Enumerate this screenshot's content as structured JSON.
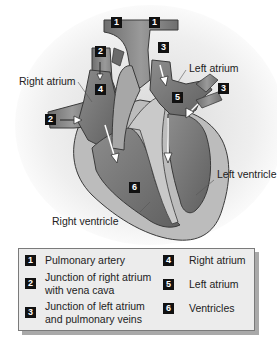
{
  "diagram": {
    "labels": {
      "right_atrium": "Right atrium",
      "left_atrium": "Left atrium",
      "left_ventricle": "Left ventricle",
      "right_ventricle": "Right ventricle"
    },
    "markers": [
      {
        "id": "1a",
        "number": "1"
      },
      {
        "id": "1b",
        "number": "1"
      },
      {
        "id": "2a",
        "number": "2"
      },
      {
        "id": "2b",
        "number": "2"
      },
      {
        "id": "3a",
        "number": "3"
      },
      {
        "id": "3b",
        "number": "3"
      },
      {
        "id": "4",
        "number": "4"
      },
      {
        "id": "5",
        "number": "5"
      },
      {
        "id": "6",
        "number": "6"
      }
    ],
    "colors": {
      "wall": "#b9b9b9",
      "wall_outline": "#3a3a3a",
      "chamber": "#7d7d7d",
      "chamber_dark": "#6a6a6a",
      "vessel": "#8a8a8a",
      "badge": "#111111",
      "legend_bg": "#ececec"
    }
  },
  "legend": {
    "items": [
      {
        "number": "1",
        "text": "Pulmonary artery"
      },
      {
        "number": "2",
        "text": "Junction of right atrium\nwith vena cava"
      },
      {
        "number": "3",
        "text": "Junction of left atrium\nand pulmonary veins"
      },
      {
        "number": "4",
        "text": "Right atrium"
      },
      {
        "number": "5",
        "text": "Left atrium"
      },
      {
        "number": "6",
        "text": "Ventricles"
      }
    ]
  }
}
